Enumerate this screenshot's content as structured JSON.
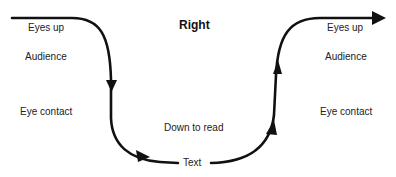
{
  "diagram": {
    "title": "Right",
    "left_column": {
      "eyes_up": "Eyes up",
      "audience": "Audience",
      "eye_contact": "Eye contact"
    },
    "right_column": {
      "eyes_up": "Eyes up",
      "audience": "Audience",
      "eye_contact": "Eye contact"
    },
    "center": {
      "down_to_read": "Down to read",
      "text": "Text"
    },
    "colors": {
      "stroke": "#111111",
      "background": "#ffffff"
    }
  }
}
